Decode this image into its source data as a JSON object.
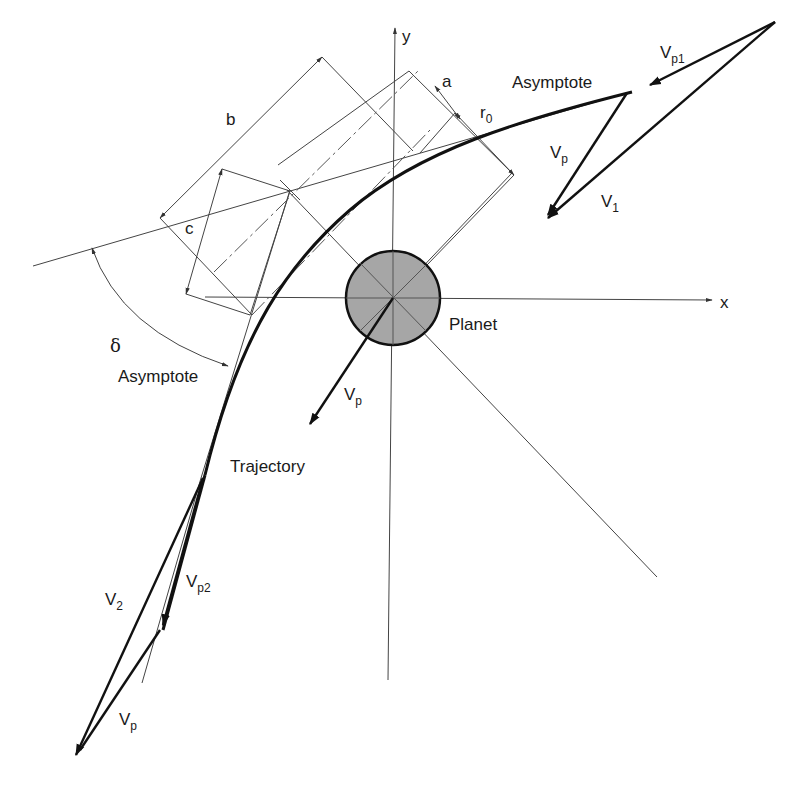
{
  "diagram": {
    "colors": {
      "background": "#ffffff",
      "line": "#111111",
      "thin_line": "#444444",
      "planet_fill": "#a6a6a6"
    },
    "axes": {
      "x_label": "x",
      "y_label": "y"
    },
    "labels": {
      "planet": "Planet",
      "trajectory": "Trajectory",
      "asymptote_upper": "Asymptote",
      "asymptote_lower": "Asymptote",
      "dim_a": "a",
      "dim_b": "b",
      "dim_c": "c",
      "r0_main": "r",
      "r0_sub": "0",
      "delta": "δ"
    },
    "vectors": {
      "vp1_main": "V",
      "vp1_sub": "p1",
      "v1_main": "V",
      "v1_sub": "1",
      "vp_top_main": "V",
      "vp_top_sub": "p",
      "vp_planet_main": "V",
      "vp_planet_sub": "p",
      "v2_main": "V",
      "v2_sub": "2",
      "vp2_main": "V",
      "vp2_sub": "p2",
      "vp_bottom_main": "V",
      "vp_bottom_sub": "p"
    }
  }
}
